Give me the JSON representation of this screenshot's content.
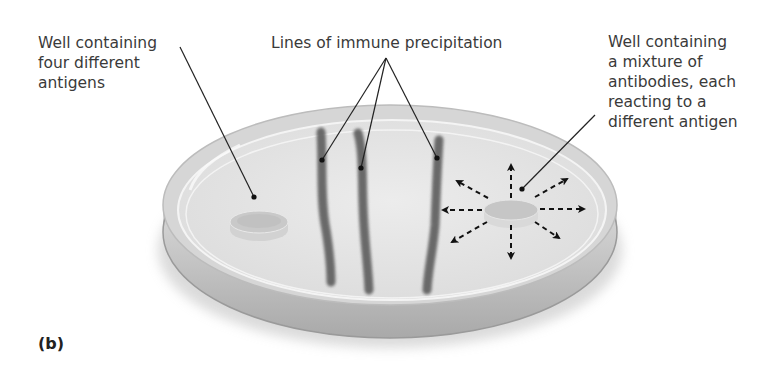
{
  "figure": {
    "part_label": "(b)",
    "labels": {
      "left_well": "Well containing\nfour different\nantigens",
      "precipitation": "Lines of immune precipitation",
      "right_well": "Well containing\na mixture of\nantibodies, each\nreacting to a\ndifferent antigen"
    },
    "elements": {
      "petri_dish": "agar-plate",
      "antigen_well": "left-well",
      "antibody_well": "right-well",
      "precipitation_lines_count": 3,
      "diffusion_arrows_count": 8
    },
    "colors": {
      "dish_rim": "#c9c9c9",
      "agar": "#e4e4e4",
      "precipitate": "#5e5e5e",
      "leader_line": "#222222",
      "text": "#3a3a3a"
    }
  }
}
